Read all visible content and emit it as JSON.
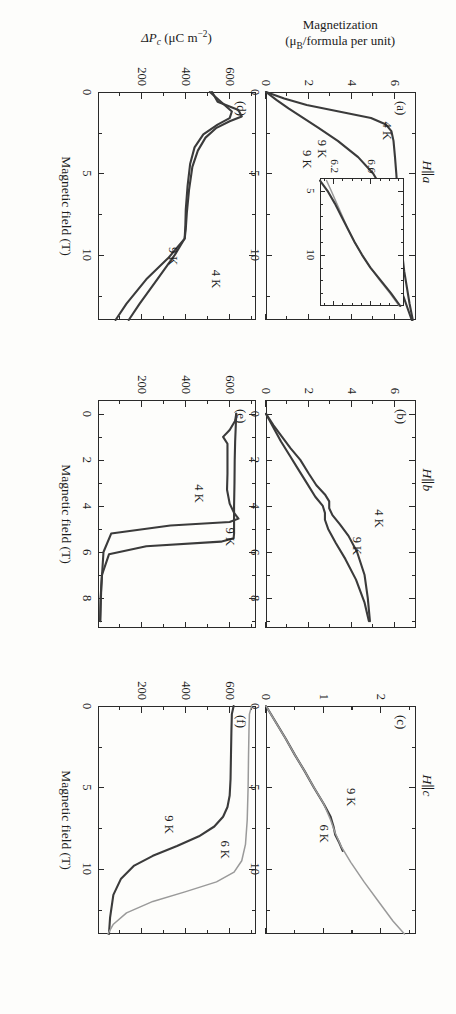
{
  "figure": {
    "orientation_note": "printed upside down",
    "xaxis_title": "Magnetic field (T)",
    "y_title_magnetization_line1": "Magnetization",
    "y_title_magnetization_line2": "(μB/formula per unit)",
    "y_title_polarization": "ΔP",
    "y_title_polarization_sub": "c",
    "y_title_polarization_units": " (μC m",
    "y_title_polarization_exp": "−2",
    "y_title_polarization_close": ")"
  },
  "panels": [
    {
      "id": "a",
      "tag": "(a)",
      "orientation": "H∥a",
      "xticks": [
        "0",
        "5",
        "10"
      ],
      "yticks": [
        "0",
        "2",
        "4",
        "6"
      ],
      "curves": [
        "4 K",
        "9 K"
      ],
      "label_4K": "4 K",
      "label_9K": "9 K"
    },
    {
      "id": "b",
      "tag": "(b)",
      "orientation": "H∥b",
      "xticks": [
        "0",
        "2",
        "4",
        "6",
        "8"
      ],
      "yticks": [
        "0",
        "2",
        "4",
        "6"
      ],
      "curves": [
        "4 K",
        "9 K"
      ],
      "label_4K": "4 K",
      "label_9K": "9 K"
    },
    {
      "id": "c",
      "tag": "(c)",
      "orientation": "H∥c",
      "xticks": [
        "0",
        "5",
        "10"
      ],
      "yticks": [
        "0",
        "1",
        "2"
      ],
      "curves": [
        "6 K",
        "9 K"
      ],
      "label_6K": "6 K",
      "label_9K": "9 K"
    },
    {
      "id": "d",
      "tag": "(d)",
      "orientation": "",
      "xticks": [
        "0",
        "5",
        "10"
      ],
      "yticks": [
        "200",
        "400",
        "600"
      ],
      "curves": [
        "4 K",
        "9 K"
      ],
      "label_4K": "4 K",
      "label_9K": "9 K"
    },
    {
      "id": "e",
      "tag": "(e)",
      "orientation": "",
      "xticks": [
        "0",
        "2",
        "4",
        "6",
        "8"
      ],
      "yticks": [
        "200",
        "400",
        "600"
      ],
      "curves": [
        "4 K",
        "9 K"
      ],
      "label_4K": "4 K",
      "label_9K": "9 K"
    },
    {
      "id": "f",
      "tag": "(f)",
      "orientation": "",
      "xticks": [
        "0",
        "5",
        "10"
      ],
      "yticks": [
        "200",
        "400",
        "600"
      ],
      "curves": [
        "6 K",
        "9 K"
      ],
      "label_6K": "6 K",
      "label_9K": "9 K"
    }
  ],
  "inset": {
    "xticks": [
      "5",
      "10"
    ],
    "yticks": [
      "6.2",
      "6.6"
    ],
    "label_9K": "9 K"
  },
  "chart_data": [
    {
      "type": "line",
      "panel": "a",
      "title": "(a) H∥a",
      "xlabel": "Magnetic field (T)",
      "ylabel": "Magnetization (μB/formula per unit)",
      "xlim": [
        0,
        14
      ],
      "ylim": [
        0,
        7
      ],
      "xticks": [
        0,
        5,
        10
      ],
      "yticks": [
        0,
        2,
        4,
        6
      ],
      "grid": false,
      "series": [
        {
          "name": "4 K",
          "x": [
            0,
            0.4,
            0.8,
            1.2,
            1.6,
            2.0,
            2.4,
            3.0,
            4.0,
            5.0,
            6.0,
            7.5,
            9.0,
            11.0,
            13.0,
            14.0
          ],
          "y": [
            0,
            0.85,
            1.9,
            3.4,
            4.9,
            5.6,
            5.85,
            5.95,
            6.02,
            6.08,
            6.13,
            6.2,
            6.28,
            6.45,
            6.7,
            6.85
          ]
        },
        {
          "name": "9 K",
          "x": [
            0,
            0.5,
            1.0,
            1.6,
            2.2,
            3.0,
            4.0,
            5.0,
            6.0,
            7.0,
            8.0,
            9.5,
            11.0,
            12.5,
            14.0
          ],
          "y": [
            0,
            0.5,
            1.05,
            1.75,
            2.45,
            3.35,
            4.3,
            5.0,
            5.45,
            5.7,
            5.85,
            6.0,
            6.15,
            6.4,
            6.8
          ]
        }
      ]
    },
    {
      "type": "line",
      "panel": "b",
      "title": "(b) H∥b",
      "xlabel": "Magnetic field (T)",
      "ylabel": "Magnetization (μB/formula per unit)",
      "xlim": [
        -0.6,
        9.3
      ],
      "ylim": [
        0,
        7
      ],
      "xticks": [
        0,
        2,
        4,
        6,
        8
      ],
      "yticks": [
        0,
        2,
        4,
        6
      ],
      "grid": false,
      "series": [
        {
          "name": "4 K",
          "x": [
            0,
            0.5,
            1.0,
            1.5,
            2.0,
            2.6,
            3.1,
            3.5,
            3.8,
            4.1,
            4.4,
            4.8,
            5.3,
            6.0,
            7.0,
            8.0,
            9.0
          ],
          "y": [
            0,
            0.35,
            0.75,
            1.15,
            1.6,
            2.0,
            2.35,
            2.75,
            2.95,
            2.95,
            3.1,
            3.45,
            3.85,
            4.25,
            4.6,
            4.75,
            4.85
          ]
        },
        {
          "name": "9 K",
          "x": [
            0,
            0.6,
            1.2,
            1.8,
            2.4,
            3.0,
            3.6,
            4.0,
            4.3,
            4.6,
            5.0,
            5.6,
            6.3,
            7.2,
            8.2,
            9.0
          ],
          "y": [
            0,
            0.35,
            0.7,
            1.1,
            1.5,
            1.9,
            2.3,
            2.65,
            2.75,
            2.75,
            2.9,
            3.25,
            3.7,
            4.2,
            4.6,
            4.8
          ]
        }
      ]
    },
    {
      "type": "line",
      "panel": "c",
      "title": "(c) H∥c",
      "xlabel": "Magnetic field (T)",
      "ylabel": "Magnetization (μB/formula per unit)",
      "xlim": [
        0,
        14
      ],
      "ylim": [
        0,
        2.6
      ],
      "xticks": [
        0,
        5,
        10
      ],
      "yticks": [
        0,
        1,
        2
      ],
      "grid": false,
      "series": [
        {
          "name": "9 K",
          "x": [
            0,
            1.0,
            2.0,
            3.0,
            4.0,
            5.0,
            6.0,
            6.8,
            7.4,
            7.9,
            8.4,
            8.9
          ],
          "y": [
            0,
            0.17,
            0.34,
            0.5,
            0.67,
            0.83,
            1.0,
            1.12,
            1.17,
            1.2,
            1.27,
            1.33
          ]
        },
        {
          "name": "6 K",
          "x": [
            0,
            1.0,
            2.0,
            3.0,
            4.0,
            5.0,
            6.0,
            7.0,
            7.8,
            8.6,
            9.6,
            10.8,
            12.0,
            13.2,
            14.0
          ],
          "y": [
            0,
            0.17,
            0.34,
            0.5,
            0.67,
            0.83,
            1.0,
            1.12,
            1.2,
            1.3,
            1.47,
            1.7,
            1.95,
            2.2,
            2.4
          ]
        }
      ]
    },
    {
      "type": "line",
      "panel": "d",
      "title": "(d)",
      "xlabel": "Magnetic field (T)",
      "ylabel": "ΔPc (μC m−2)",
      "xlim": [
        0,
        14
      ],
      "ylim": [
        0,
        720
      ],
      "xticks": [
        0,
        5,
        10
      ],
      "yticks": [
        200,
        400,
        600
      ],
      "grid": false,
      "series": [
        {
          "name": "4 K",
          "x": [
            0,
            0.6,
            1.1,
            1.5,
            1.8,
            2.2,
            2.8,
            3.6,
            4.6,
            6.0,
            7.4,
            8.4,
            9.0,
            10.0,
            11.5,
            13.0,
            14.0
          ],
          "y": [
            520,
            545,
            640,
            655,
            600,
            540,
            490,
            455,
            430,
            415,
            405,
            400,
            395,
            350,
            270,
            190,
            140
          ]
        },
        {
          "name": "9 K",
          "x": [
            0,
            0.6,
            1.2,
            1.6,
            2.0,
            2.6,
            3.4,
            4.4,
            5.8,
            7.2,
            8.2,
            9.0,
            10.2,
            11.5,
            13.0,
            14.0
          ],
          "y": [
            510,
            560,
            610,
            600,
            545,
            480,
            440,
            420,
            408,
            400,
            398,
            395,
            320,
            220,
            130,
            80
          ]
        }
      ]
    },
    {
      "type": "line",
      "panel": "e",
      "title": "(e)",
      "xlabel": "Magnetic field (T)",
      "ylabel": "ΔPc (μC m−2)",
      "xlim": [
        -0.6,
        9.3
      ],
      "ylim": [
        0,
        720
      ],
      "xticks": [
        0,
        2,
        4,
        6,
        8
      ],
      "yticks": [
        200,
        400,
        600
      ],
      "grid": false,
      "series": [
        {
          "name": "4 K",
          "x": [
            0,
            0.3,
            0.7,
            1.0,
            1.3,
            1.8,
            2.6,
            3.3,
            3.9,
            4.3,
            4.55,
            4.7,
            4.85,
            5.2,
            6.0,
            7.5,
            9.0
          ],
          "y": [
            630,
            625,
            600,
            570,
            590,
            590,
            590,
            588,
            600,
            620,
            640,
            600,
            330,
            60,
            25,
            15,
            10
          ]
        },
        {
          "name": "9 K",
          "x": [
            0,
            0.5,
            1.2,
            2.0,
            3.0,
            4.0,
            4.8,
            5.2,
            5.4,
            5.55,
            5.75,
            6.1,
            7.0,
            8.0,
            9.0
          ],
          "y": [
            630,
            628,
            625,
            623,
            622,
            620,
            620,
            620,
            618,
            560,
            220,
            50,
            18,
            12,
            10
          ]
        }
      ]
    },
    {
      "type": "line",
      "panel": "f",
      "title": "(f)",
      "xlabel": "Magnetic field (T)",
      "ylabel": "ΔPc (μC m−2)",
      "xlim": [
        0,
        14
      ],
      "ylim": [
        0,
        720
      ],
      "xticks": [
        0,
        5,
        10
      ],
      "yticks": [
        200,
        400,
        600
      ],
      "grid": false,
      "series": [
        {
          "name": "9 K",
          "x": [
            0,
            0.5,
            1.5,
            3.0,
            4.5,
            5.5,
            6.2,
            6.8,
            7.4,
            8.0,
            8.6,
            9.2,
            9.8,
            10.6,
            11.6,
            13.0,
            14.0
          ],
          "y": [
            618,
            610,
            608,
            606,
            604,
            600,
            590,
            570,
            530,
            460,
            360,
            250,
            165,
            105,
            70,
            55,
            50
          ]
        },
        {
          "name": "6 K",
          "x": [
            0,
            0.5,
            1.5,
            3.0,
            5.0,
            7.0,
            8.5,
            9.5,
            10.2,
            10.8,
            11.4,
            12.0,
            12.7,
            13.4,
            14.0
          ],
          "y": [
            700,
            690,
            688,
            686,
            684,
            680,
            672,
            655,
            620,
            540,
            400,
            250,
            130,
            70,
            45
          ]
        }
      ]
    },
    {
      "type": "line",
      "panel": "a-inset",
      "title": "inset of panel (a)",
      "xlabel": "",
      "ylabel": "",
      "xlim": [
        4.0,
        14.0
      ],
      "ylim": [
        6.05,
        6.95
      ],
      "xticks": [
        5,
        10
      ],
      "yticks": [
        6.2,
        6.6
      ],
      "grid": false,
      "series": [
        {
          "name": "4 K",
          "x": [
            4.2,
            5.0,
            6.0,
            7.0,
            8.0,
            9.0,
            10.0,
            11.0,
            12.0,
            13.0,
            14.0
          ],
          "y": [
            6.12,
            6.17,
            6.23,
            6.29,
            6.35,
            6.42,
            6.5,
            6.59,
            6.69,
            6.8,
            6.9
          ]
        },
        {
          "name": "9 K",
          "x": [
            4.2,
            5.0,
            6.0,
            7.0,
            8.0,
            9.0,
            10.0,
            11.0,
            12.0,
            13.0,
            14.0
          ],
          "y": [
            6.05,
            6.13,
            6.21,
            6.28,
            6.35,
            6.42,
            6.5,
            6.59,
            6.7,
            6.81,
            6.91
          ]
        }
      ]
    }
  ]
}
